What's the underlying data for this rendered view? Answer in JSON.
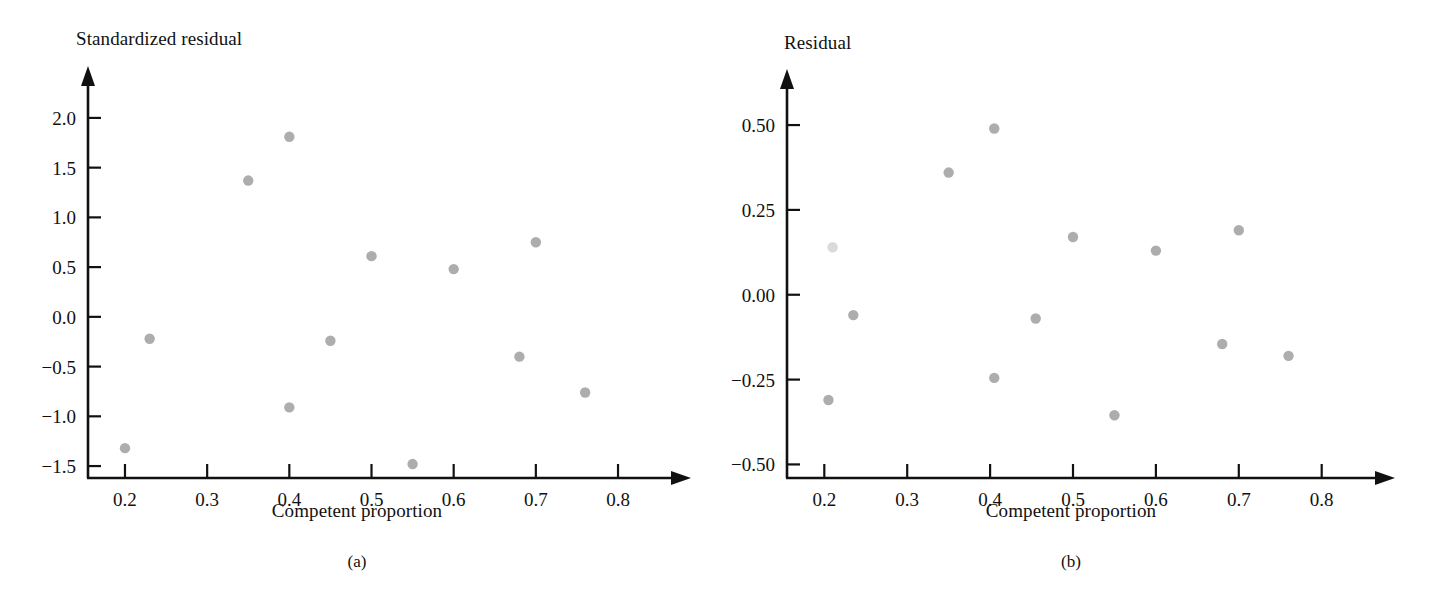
{
  "figure": {
    "panels": [
      {
        "caption": "(a)",
        "x_axis_label": "Competent proportion",
        "y_axis_label": "Standardized residual"
      },
      {
        "caption": "(b)",
        "x_axis_label": "Competent proportion",
        "y_axis_label": "Residual"
      }
    ]
  },
  "style": {
    "point_color": "#adadad",
    "axis_color": "#111111",
    "background": "#ffffff"
  },
  "chart_data": [
    {
      "type": "scatter",
      "title": "(a)",
      "xlabel": "Competent proportion",
      "ylabel": "Standardized residual",
      "xlim": [
        0.155,
        0.845
      ],
      "ylim": [
        -1.62,
        2.18
      ],
      "xticks": [
        0.2,
        0.3,
        0.4,
        0.5,
        0.6,
        0.7,
        0.8
      ],
      "xtick_labels": [
        "0.2",
        "0.3",
        "0.4",
        "0.5",
        "0.6",
        "0.7",
        "0.8"
      ],
      "yticks": [
        -1.5,
        -1.0,
        -0.5,
        0.0,
        0.5,
        1.0,
        1.5,
        2.0
      ],
      "ytick_labels": [
        "−1.5",
        "−1.0",
        "−0.5",
        "0.0",
        "0.5",
        "1.0",
        "1.5",
        "2.0"
      ],
      "grid": false,
      "legend": null,
      "x": [
        0.2,
        0.21,
        0.23,
        0.35,
        0.4,
        0.4,
        0.45,
        0.5,
        0.55,
        0.6,
        0.68,
        0.7,
        0.76
      ],
      "y": [
        -1.32,
        null,
        -0.22,
        1.37,
        1.81,
        -0.91,
        -0.24,
        0.61,
        -1.48,
        0.48,
        -0.4,
        0.75,
        -0.76
      ],
      "points": [
        {
          "x": 0.2,
          "y": -1.32
        },
        {
          "x": 0.23,
          "y": -0.22
        },
        {
          "x": 0.35,
          "y": 1.37
        },
        {
          "x": 0.4,
          "y": 1.81
        },
        {
          "x": 0.4,
          "y": -0.91
        },
        {
          "x": 0.45,
          "y": -0.24
        },
        {
          "x": 0.5,
          "y": 0.61
        },
        {
          "x": 0.55,
          "y": -1.48
        },
        {
          "x": 0.6,
          "y": 0.48
        },
        {
          "x": 0.68,
          "y": -0.4
        },
        {
          "x": 0.7,
          "y": 0.75
        },
        {
          "x": 0.76,
          "y": -0.76
        }
      ]
    },
    {
      "type": "scatter",
      "title": "(b)",
      "xlabel": "Competent proportion",
      "ylabel": "Residual",
      "xlim": [
        0.155,
        0.845
      ],
      "ylim": [
        -0.54,
        0.565
      ],
      "xticks": [
        0.2,
        0.3,
        0.4,
        0.5,
        0.6,
        0.7,
        0.8
      ],
      "xtick_labels": [
        "0.2",
        "0.3",
        "0.4",
        "0.5",
        "0.6",
        "0.7",
        "0.8"
      ],
      "yticks": [
        -0.5,
        -0.25,
        0.0,
        0.25,
        0.5
      ],
      "ytick_labels": [
        "−0.50",
        "−0.25",
        "0.00",
        "0.25",
        "0.50"
      ],
      "grid": false,
      "legend": null,
      "x": [
        0.205,
        0.21,
        0.235,
        0.35,
        0.405,
        0.405,
        0.455,
        0.5,
        0.55,
        0.6,
        0.68,
        0.7,
        0.76
      ],
      "y": [
        -0.31,
        0.14,
        -0.06,
        0.36,
        0.49,
        -0.245,
        -0.07,
        0.17,
        -0.355,
        0.13,
        -0.145,
        0.19,
        -0.18
      ],
      "points": [
        {
          "x": 0.205,
          "y": -0.31
        },
        {
          "x": 0.21,
          "y": 0.14
        },
        {
          "x": 0.235,
          "y": -0.06
        },
        {
          "x": 0.35,
          "y": 0.36
        },
        {
          "x": 0.405,
          "y": 0.49
        },
        {
          "x": 0.405,
          "y": -0.245
        },
        {
          "x": 0.455,
          "y": -0.07
        },
        {
          "x": 0.5,
          "y": 0.17
        },
        {
          "x": 0.55,
          "y": -0.355
        },
        {
          "x": 0.6,
          "y": 0.13
        },
        {
          "x": 0.68,
          "y": -0.145
        },
        {
          "x": 0.7,
          "y": 0.19
        },
        {
          "x": 0.76,
          "y": -0.18
        }
      ]
    }
  ]
}
